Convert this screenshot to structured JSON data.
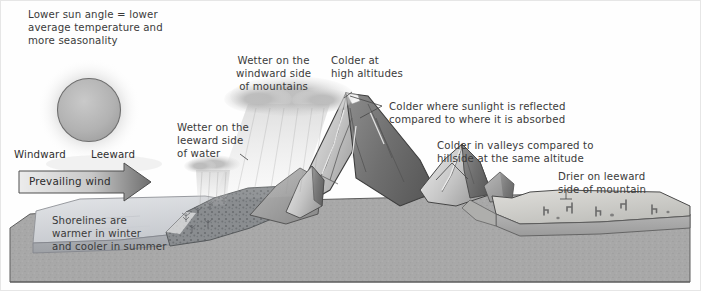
{
  "diagram": {
    "background_color": "#fefefe",
    "text_color": "#3a3a3a"
  },
  "annotations": {
    "sun_angle": "Lower sun angle = lower\naverage temperature and\nmore seasonality",
    "wetter_windward_mountains": "Wetter on the\nwindward side\nof mountains",
    "colder_high_altitudes": "Colder at\nhigh altitudes",
    "colder_sunlight_reflected": "Colder where sunlight is reflected\ncompared to where it is absorbed",
    "wetter_leeward_water": "Wetter on the\nleeward side\nof water",
    "colder_valleys": "Colder in valleys compared to\nhillside at the same altitude",
    "drier_leeward_mountain": "Drier on leeward\nside of mountain",
    "shorelines": "Shorelines are\nwarmer in winter\nand cooler in summer"
  },
  "direction_labels": {
    "windward": "Windward",
    "leeward": "Leeward"
  },
  "wind_arrow": {
    "label": "Prevailing wind",
    "fill_light": "#e8e8e8",
    "fill_dark": "#6f6f6f",
    "stroke": "#4a4a4a"
  },
  "features": {
    "sun": {
      "name": "sun",
      "fill": "#b4b4b4",
      "stroke": "#6b6b6b"
    },
    "water": {
      "name": "lake-water",
      "fill": "#d8dade"
    },
    "forest_slope": {
      "name": "forested-windward-slope",
      "fill": "#8e9094"
    },
    "mountains": {
      "name": "mountain-range",
      "fill": "#9a9a9a"
    },
    "desert_plateau": {
      "name": "leeward-desert-plateau",
      "fill": "#c9c9c6"
    },
    "bedrock": {
      "name": "bedrock-cross-section",
      "fill": "#a9a9a9"
    },
    "clouds": {
      "name": "rain-clouds",
      "fill": "#c2c2c2"
    },
    "cacti": {
      "name": "desert-cacti",
      "fill": "#6d6d6d"
    }
  }
}
